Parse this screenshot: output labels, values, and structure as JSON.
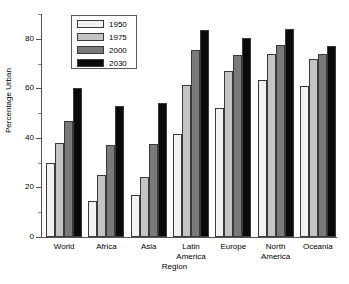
{
  "chart_data": {
    "type": "bar",
    "title": "",
    "xlabel": "Region",
    "ylabel": "Percentage Urban",
    "categories": [
      "World",
      "Africa",
      "Asia",
      "Latin\nAmerica",
      "Europe",
      "North\nAmerica",
      "Oceania"
    ],
    "ylim": [
      0,
      90
    ],
    "yticks": [
      0,
      20,
      40,
      60,
      80
    ],
    "yticklabels": [
      "0",
      "20",
      "40",
      "60",
      "80"
    ],
    "minor_yticks": [
      10,
      30,
      50,
      70,
      90
    ],
    "grid": false,
    "legend_position": "upper left",
    "series": [
      {
        "name": "1950",
        "color": "#f2f2f2",
        "values": [
          29.8,
          14.5,
          17.0,
          41.5,
          52.0,
          63.5,
          61.0
        ]
      },
      {
        "name": "1975",
        "color": "#c4c4c4",
        "values": [
          37.8,
          25.0,
          24.2,
          61.2,
          67.0,
          73.8,
          71.8
        ]
      },
      {
        "name": "2000",
        "color": "#7a7a7a",
        "values": [
          47.0,
          37.0,
          37.4,
          75.4,
          73.4,
          77.3,
          73.8
        ]
      },
      {
        "name": "2030",
        "color": "#0a0a0a",
        "values": [
          60.2,
          52.8,
          53.9,
          83.7,
          80.2,
          84.0,
          77.1
        ]
      }
    ]
  },
  "axis": {
    "ylabel": "Percentage Urban",
    "xlabel": "Region"
  }
}
